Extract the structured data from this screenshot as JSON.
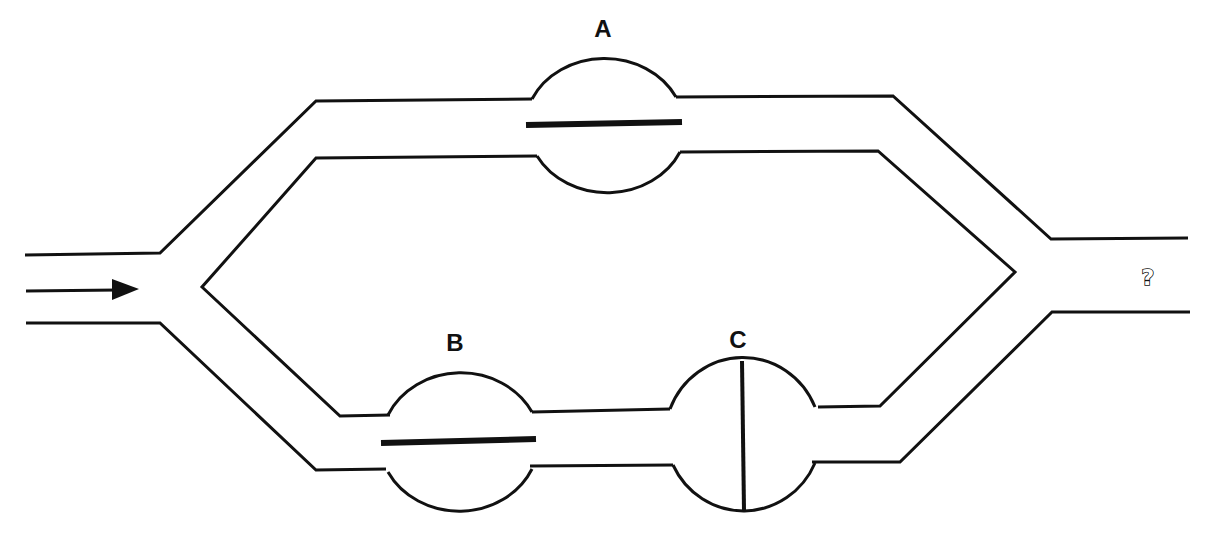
{
  "diagram": {
    "colors": {
      "line": "#111111",
      "background": "#ffffff"
    },
    "inlet": {
      "arrow": "right-arrow",
      "direction": "left-to-right"
    },
    "outlet": {
      "label": "?"
    },
    "valves": [
      {
        "id": "A",
        "label": "A",
        "branch": "upper",
        "disc_orientation": "horizontal",
        "state": "open"
      },
      {
        "id": "B",
        "label": "B",
        "branch": "lower",
        "disc_orientation": "horizontal",
        "state": "open"
      },
      {
        "id": "C",
        "label": "C",
        "branch": "lower",
        "disc_orientation": "vertical",
        "state": "closed"
      }
    ]
  }
}
